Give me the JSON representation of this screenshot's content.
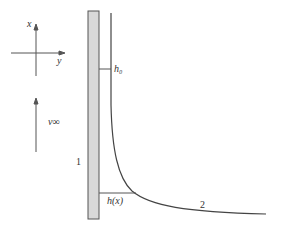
{
  "diagram": {
    "axes": {
      "x_label": "x",
      "y_label": "y"
    },
    "velocity_label": "ν∞",
    "labels": {
      "plate": "1",
      "film": "2",
      "h0": "h₀",
      "hx": "h(x)"
    },
    "colors": {
      "plate_fill": "#d9d9d9",
      "line": "#444444",
      "text": "#333333"
    }
  }
}
